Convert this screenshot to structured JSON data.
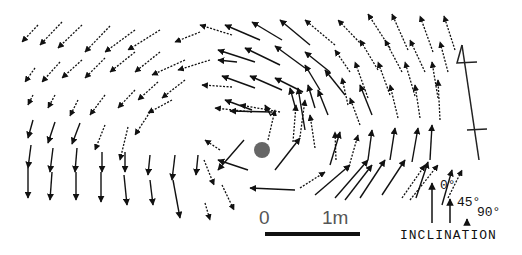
{
  "figure": {
    "type": "vector-field-map",
    "center_marker": {
      "x": 262,
      "y": 150,
      "r": 8,
      "color": "#666666"
    }
  },
  "scale_bar": {
    "start_label": "0",
    "end_label": "1m",
    "x1": 265,
    "x2": 360,
    "y": 232
  },
  "north_arrow": {
    "label": "N",
    "x1": 462,
    "y1": 45,
    "x2": 479,
    "y2": 160
  },
  "legend": {
    "title": "INCLINATION",
    "items": [
      {
        "label": "0°",
        "length": 40
      },
      {
        "label": "45°",
        "length": 24
      },
      {
        "label": "90°",
        "length": 4
      }
    ]
  },
  "line_styles": {
    "solid": "solid",
    "dashed": "dashed"
  },
  "arrows": [
    [
      38,
      25,
      22,
      42,
      "d"
    ],
    [
      62,
      22,
      40,
      45,
      "d"
    ],
    [
      82,
      25,
      58,
      48,
      "d"
    ],
    [
      110,
      26,
      85,
      52,
      "d"
    ],
    [
      135,
      30,
      105,
      52,
      "d"
    ],
    [
      160,
      30,
      128,
      50,
      "d"
    ],
    [
      200,
      32,
      175,
      42,
      "d"
    ],
    [
      35,
      68,
      25,
      82,
      "d"
    ],
    [
      60,
      62,
      42,
      82,
      "d"
    ],
    [
      82,
      60,
      62,
      78,
      "d"
    ],
    [
      105,
      58,
      85,
      78,
      "d"
    ],
    [
      135,
      52,
      110,
      72,
      "d"
    ],
    [
      160,
      52,
      135,
      72,
      "d"
    ],
    [
      185,
      60,
      152,
      75,
      "d"
    ],
    [
      210,
      60,
      178,
      70,
      "d"
    ],
    [
      33,
      95,
      28,
      105,
      "d"
    ],
    [
      55,
      95,
      48,
      108,
      "d"
    ],
    [
      78,
      100,
      70,
      116,
      "d"
    ],
    [
      105,
      95,
      90,
      115,
      "d"
    ],
    [
      135,
      90,
      118,
      108,
      "d"
    ],
    [
      158,
      82,
      138,
      100,
      "d"
    ],
    [
      185,
      80,
      162,
      98,
      "d"
    ],
    [
      33,
      120,
      28,
      138,
      "s"
    ],
    [
      55,
      122,
      48,
      143,
      "s"
    ],
    [
      80,
      123,
      72,
      144,
      "s"
    ],
    [
      105,
      125,
      95,
      150,
      "d"
    ],
    [
      128,
      127,
      120,
      160,
      "d"
    ],
    [
      150,
      112,
      135,
      135,
      "d"
    ],
    [
      172,
      100,
      148,
      113,
      "d"
    ],
    [
      31,
      145,
      28,
      168,
      "s"
    ],
    [
      53,
      148,
      50,
      172,
      "s"
    ],
    [
      77,
      148,
      75,
      172,
      "s"
    ],
    [
      102,
      152,
      102,
      172,
      "s"
    ],
    [
      125,
      152,
      125,
      172,
      "s"
    ],
    [
      150,
      155,
      148,
      175,
      "s"
    ],
    [
      175,
      155,
      172,
      180,
      "s"
    ],
    [
      28,
      168,
      28,
      198,
      "s"
    ],
    [
      52,
      172,
      50,
      200,
      "s"
    ],
    [
      76,
      172,
      76,
      200,
      "s"
    ],
    [
      101,
      172,
      101,
      202,
      "s"
    ],
    [
      124,
      175,
      127,
      205,
      "s"
    ],
    [
      150,
      180,
      153,
      205,
      "s"
    ],
    [
      173,
      180,
      180,
      218,
      "s"
    ],
    [
      198,
      155,
      196,
      175,
      "s"
    ],
    [
      204,
      160,
      214,
      185,
      "d"
    ],
    [
      222,
      185,
      234,
      210,
      "d"
    ],
    [
      205,
      203,
      210,
      220,
      "d"
    ],
    [
      232,
      35,
      200,
      25,
      "d"
    ],
    [
      260,
      40,
      225,
      25,
      "s"
    ],
    [
      282,
      40,
      252,
      22,
      "s"
    ],
    [
      310,
      45,
      280,
      20,
      "s"
    ],
    [
      335,
      45,
      305,
      20,
      "d"
    ],
    [
      362,
      45,
      338,
      20,
      "d"
    ],
    [
      390,
      48,
      368,
      14,
      "d"
    ],
    [
      408,
      50,
      392,
      14,
      "d"
    ],
    [
      433,
      52,
      420,
      16,
      "d"
    ],
    [
      455,
      50,
      444,
      16,
      "d"
    ],
    [
      237,
      62,
      218,
      60,
      "s"
    ],
    [
      255,
      62,
      218,
      50,
      "s"
    ],
    [
      280,
      65,
      245,
      48,
      "s"
    ],
    [
      305,
      68,
      275,
      46,
      "s"
    ],
    [
      330,
      72,
      305,
      52,
      "s"
    ],
    [
      350,
      72,
      335,
      50,
      "d"
    ],
    [
      378,
      70,
      360,
      40,
      "d"
    ],
    [
      402,
      72,
      385,
      40,
      "d"
    ],
    [
      425,
      72,
      410,
      40,
      "d"
    ],
    [
      448,
      72,
      440,
      42,
      "d"
    ],
    [
      232,
      87,
      202,
      85,
      "d"
    ],
    [
      255,
      88,
      222,
      76,
      "s"
    ],
    [
      282,
      90,
      250,
      76,
      "s"
    ],
    [
      303,
      92,
      275,
      78,
      "s"
    ],
    [
      320,
      90,
      305,
      65,
      "s"
    ],
    [
      345,
      95,
      325,
      70,
      "s"
    ],
    [
      368,
      98,
      355,
      62,
      "d"
    ],
    [
      390,
      95,
      378,
      62,
      "d"
    ],
    [
      415,
      96,
      405,
      62,
      "d"
    ],
    [
      438,
      98,
      432,
      62,
      "d"
    ],
    [
      252,
      110,
      225,
      100,
      "s"
    ],
    [
      280,
      112,
      240,
      105,
      "d"
    ],
    [
      296,
      110,
      290,
      88,
      "s"
    ],
    [
      315,
      108,
      308,
      85,
      "s"
    ],
    [
      328,
      115,
      318,
      90,
      "s"
    ],
    [
      348,
      105,
      342,
      78,
      "d"
    ],
    [
      372,
      115,
      360,
      85,
      "s"
    ],
    [
      398,
      118,
      390,
      85,
      "d"
    ],
    [
      420,
      118,
      415,
      85,
      "d"
    ],
    [
      440,
      120,
      438,
      80,
      "d"
    ],
    [
      252,
      112,
      215,
      108,
      "d"
    ],
    [
      271,
      116,
      265,
      105,
      "s"
    ],
    [
      272,
      112,
      230,
      111,
      "s"
    ],
    [
      248,
      170,
      218,
      160,
      "s"
    ],
    [
      220,
      150,
      205,
      140,
      "d"
    ],
    [
      244,
      140,
      218,
      170,
      "s"
    ],
    [
      268,
      140,
      275,
      110,
      "d"
    ],
    [
      275,
      170,
      300,
      138,
      "s"
    ],
    [
      293,
      142,
      296,
      105,
      "d"
    ],
    [
      300,
      137,
      305,
      100,
      "d"
    ],
    [
      305,
      130,
      298,
      88,
      "s"
    ],
    [
      315,
      148,
      310,
      115,
      "d"
    ],
    [
      336,
      160,
      335,
      132,
      "d"
    ],
    [
      360,
      125,
      350,
      98,
      "d"
    ],
    [
      330,
      165,
      340,
      132,
      "s"
    ],
    [
      348,
      170,
      358,
      135,
      "d"
    ],
    [
      368,
      160,
      372,
      130,
      "s"
    ],
    [
      390,
      160,
      395,
      128,
      "s"
    ],
    [
      412,
      162,
      418,
      128,
      "s"
    ],
    [
      430,
      160,
      432,
      125,
      "s"
    ],
    [
      300,
      188,
      325,
      172,
      "d"
    ],
    [
      295,
      190,
      250,
      188,
      "s"
    ],
    [
      315,
      195,
      350,
      165,
      "s"
    ],
    [
      335,
      198,
      368,
      160,
      "s"
    ],
    [
      345,
      200,
      372,
      165,
      "s"
    ],
    [
      360,
      198,
      385,
      160,
      "s"
    ],
    [
      382,
      195,
      405,
      160,
      "s"
    ],
    [
      402,
      198,
      425,
      165,
      "d"
    ],
    [
      410,
      200,
      438,
      165,
      "d"
    ],
    [
      416,
      198,
      428,
      162,
      "s"
    ],
    [
      442,
      205,
      452,
      170,
      "s"
    ],
    [
      448,
      198,
      462,
      170,
      "d"
    ]
  ]
}
